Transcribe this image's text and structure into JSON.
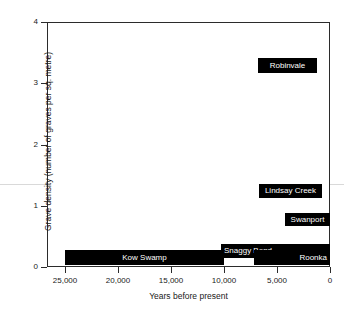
{
  "chart_data": {
    "type": "bar",
    "title": "",
    "xlabel": "Years before present",
    "ylabel": "Grave density (number of graves per sq. metre)",
    "xlim": [
      25000,
      0
    ],
    "ylim": [
      0,
      4
    ],
    "x_ticks": [
      "25,000",
      "20,000",
      "15,000",
      "10,000",
      "5,000",
      "0"
    ],
    "x_tick_values": [
      25000,
      20000,
      15000,
      10000,
      5000,
      0
    ],
    "y_ticks": [
      "0",
      "1",
      "2",
      "3",
      "4"
    ],
    "y_tick_values": [
      0,
      1,
      2,
      3,
      4
    ],
    "x_axis_reversed": true,
    "grid": false,
    "legend": "none",
    "bar_color": "#000000",
    "label_color": "#ffffff",
    "categories": [
      "Kow Swamp",
      "Snaggy Bend",
      "Roonka",
      "Swanport",
      "Lindsay Creek",
      "Robinvale"
    ],
    "values": [
      0.28,
      0.37,
      0.28,
      0.88,
      1.35,
      3.4
    ],
    "bars": [
      {
        "name": "Kow Swamp",
        "x_start": 25000,
        "x_end": 10000,
        "value": 0.28,
        "value_base": 0.03,
        "label_align": "center"
      },
      {
        "name": "Snaggy Bend",
        "x_start": 10300,
        "x_end": 0,
        "value": 0.37,
        "value_base": 0.14,
        "label_align": "left"
      },
      {
        "name": "Roonka",
        "x_start": 7200,
        "x_end": 0,
        "value": 0.28,
        "value_base": 0.03,
        "label_align": "right"
      },
      {
        "name": "Swanport",
        "x_start": 4250,
        "x_end": 0,
        "value": 0.88,
        "value_base": 0.67,
        "label_align": "center"
      },
      {
        "name": "Lindsay Creek",
        "x_start": 6700,
        "x_end": 750,
        "value": 1.35,
        "value_base": 1.12,
        "label_align": "center"
      },
      {
        "name": "Robinvale",
        "x_start": 6800,
        "x_end": 1250,
        "value": 3.42,
        "value_base": 3.17,
        "label_align": "center"
      }
    ]
  }
}
